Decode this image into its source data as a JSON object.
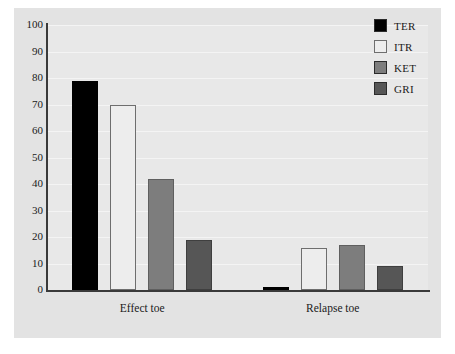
{
  "chart_data": {
    "type": "bar",
    "title": "",
    "subtitle": "",
    "xlabel": "",
    "ylabel": "",
    "categories": [
      "Effect toe",
      "Relapse toe"
    ],
    "series": [
      {
        "name": "TER",
        "color": "#000000",
        "values": [
          79,
          1
        ]
      },
      {
        "name": "ITR",
        "color": "#ededed",
        "values": [
          70,
          16
        ]
      },
      {
        "name": "KET",
        "color": "#7d7d7d",
        "values": [
          42,
          17
        ]
      },
      {
        "name": "GRI",
        "color": "#565656",
        "values": [
          19,
          9
        ]
      }
    ],
    "ylim": [
      0,
      100
    ],
    "yticks": [
      0,
      10,
      20,
      30,
      40,
      50,
      60,
      70,
      80,
      90,
      100
    ],
    "ytick_labels": [
      "0",
      "10",
      "20",
      "30",
      "40",
      "50",
      "60",
      "70",
      "80",
      "90",
      "100"
    ],
    "grid": true,
    "grid_axis": "y",
    "legend_position": "top-right",
    "bar_group_gap": true,
    "plot_background": "#e8e8e8",
    "figure_background": "#e3e3e3",
    "axis_color": "#3a3a3a"
  },
  "legend": {
    "items": [
      {
        "label": "TER",
        "color": "#000000"
      },
      {
        "label": "ITR",
        "color": "#ededed"
      },
      {
        "label": "KET",
        "color": "#7d7d7d"
      },
      {
        "label": "GRI",
        "color": "#565656"
      }
    ]
  }
}
